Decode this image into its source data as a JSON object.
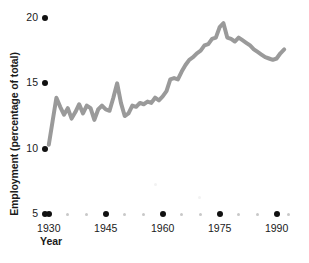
{
  "chart_data": {
    "type": "line",
    "title": "",
    "xlabel": "Year",
    "ylabel": "Employment (percentage of total)",
    "xlim": [
      1929,
      1993
    ],
    "ylim": [
      5,
      20
    ],
    "grid": false,
    "legend": null,
    "line_color": "#9a9a9a",
    "tick_color": "#111111",
    "minor_tick_color": "#c8c8c8",
    "y_ticks": [
      {
        "value": 5,
        "label": "5"
      },
      {
        "value": 10,
        "label": "10"
      },
      {
        "value": 15,
        "label": "15"
      },
      {
        "value": 20,
        "label": "20"
      }
    ],
    "x_ticks_major": [
      {
        "value": 1930,
        "label": "1930"
      },
      {
        "value": 1945,
        "label": "1945"
      },
      {
        "value": 1960,
        "label": "1960"
      },
      {
        "value": 1975,
        "label": "1975"
      },
      {
        "value": 1990,
        "label": "1990"
      }
    ],
    "x_minor_step": 5,
    "x_minor_values": [
      1935,
      1940,
      1950,
      1955,
      1965,
      1970,
      1980,
      1985,
      1993
    ],
    "series": [
      {
        "name": "Employment",
        "x": [
          1930,
          1931,
          1932,
          1933,
          1934,
          1935,
          1936,
          1937,
          1938,
          1939,
          1940,
          1941,
          1942,
          1943,
          1944,
          1945,
          1946,
          1947,
          1948,
          1949,
          1950,
          1951,
          1952,
          1953,
          1954,
          1955,
          1956,
          1957,
          1958,
          1959,
          1960,
          1961,
          1962,
          1963,
          1964,
          1965,
          1966,
          1967,
          1968,
          1969,
          1970,
          1971,
          1972,
          1973,
          1974,
          1975,
          1976,
          1977,
          1978,
          1979,
          1980,
          1981,
          1982,
          1983,
          1984,
          1985,
          1986,
          1987,
          1988,
          1989,
          1990,
          1991,
          1992
        ],
        "y": [
          10.3,
          12.1,
          13.9,
          13.2,
          12.6,
          13.1,
          12.3,
          12.8,
          13.4,
          12.7,
          13.3,
          13.1,
          12.2,
          13.0,
          13.3,
          13.0,
          12.9,
          13.9,
          15.0,
          13.5,
          12.5,
          12.7,
          13.3,
          13.2,
          13.5,
          13.4,
          13.6,
          13.5,
          13.9,
          13.7,
          14.0,
          14.4,
          15.3,
          15.4,
          15.3,
          15.9,
          16.4,
          16.8,
          17.0,
          17.3,
          17.5,
          17.9,
          18.0,
          18.4,
          18.5,
          19.3,
          19.6,
          18.5,
          18.4,
          18.2,
          18.5,
          18.3,
          18.1,
          17.9,
          17.6,
          17.4,
          17.2,
          17.0,
          16.9,
          16.8,
          16.9,
          17.3,
          17.6
        ]
      }
    ]
  }
}
